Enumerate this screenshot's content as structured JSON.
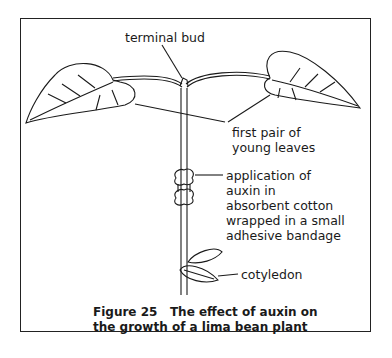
{
  "figure": {
    "number": "Figure 25",
    "caption_line1": "Figure 25   The effect of auxin on",
    "caption_line2": "the growth of a lima bean plant"
  },
  "labels": {
    "terminal_bud": "terminal bud",
    "young_leaves_line1": "first pair of",
    "young_leaves_line2": "young leaves",
    "auxin_line1": "application of",
    "auxin_line2": "auxin in",
    "auxin_line3": "absorbent cotton",
    "auxin_line4": "wrapped in a small",
    "auxin_line5": "adhesive bandage",
    "cotyledon": "cotyledon"
  },
  "colors": {
    "ink": "#1a1a1a",
    "background": "#ffffff"
  }
}
